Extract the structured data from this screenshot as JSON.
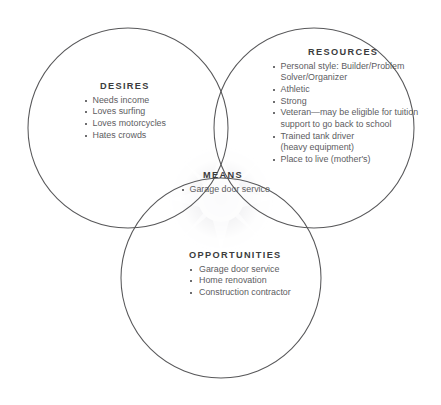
{
  "diagram": {
    "type": "venn-three-circle",
    "background_color": "#ffffff",
    "stroke_color": "#58585a",
    "heading_color": "#3b3b3d",
    "body_color": "#5d5d5f",
    "center_shading_color": "#efeff1",
    "circles": [
      {
        "id": "desires",
        "cx": 128,
        "cy": 128,
        "r": 100
      },
      {
        "id": "resources",
        "cx": 314,
        "cy": 128,
        "r": 100
      },
      {
        "id": "opportunities",
        "cx": 221,
        "cy": 278,
        "r": 100
      }
    ],
    "groups": {
      "desires": {
        "heading": "DESIRES",
        "items": [
          "Needs income",
          "Loves surfing",
          "Loves motorcycles",
          "Hates crowds"
        ]
      },
      "resources": {
        "heading": "RESOURCES",
        "items": [
          "Personal style: Builder/Problem\nSolver/Organizer",
          "Athletic",
          "Strong",
          "Veteran—may be eligible for tuition\nsupport to go back to school",
          "Trained tank driver\n(heavy equipment)",
          "Place to live (mother's)"
        ]
      },
      "means": {
        "heading": "MEANS",
        "items": [
          "Garage door service"
        ]
      },
      "opportunities": {
        "heading": "OPPORTUNITIES",
        "items": [
          "Garage door service",
          "Home renovation",
          "Construction contractor"
        ]
      }
    }
  }
}
